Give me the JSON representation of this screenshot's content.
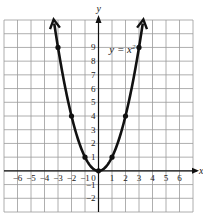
{
  "chart_data": {
    "type": "line",
    "title": "",
    "equation_label": "y = x",
    "equation_exponent": "2",
    "xlabel": "x",
    "ylabel": "y",
    "xlim": [
      -7,
      7
    ],
    "ylim": [
      -3,
      11
    ],
    "grid": true,
    "x_ticks": [
      -6,
      -5,
      -4,
      -3,
      -2,
      -1,
      0,
      1,
      2,
      3,
      4,
      5,
      6
    ],
    "y_ticks": [
      -2,
      -1,
      1,
      2,
      3,
      4,
      5,
      6,
      7,
      8,
      9
    ],
    "series": [
      {
        "name": "y = x^2",
        "points": [
          {
            "x": -3,
            "y": 9
          },
          {
            "x": -2,
            "y": 4
          },
          {
            "x": -1,
            "y": 1
          },
          {
            "x": 0,
            "y": 0
          },
          {
            "x": 1,
            "y": 1
          },
          {
            "x": 2,
            "y": 4
          },
          {
            "x": 3,
            "y": 9
          }
        ],
        "arrows_at_ends": true
      }
    ],
    "colors": {
      "curve": "#111111",
      "grid": "#9a9a9a",
      "axis": "#111111"
    }
  }
}
